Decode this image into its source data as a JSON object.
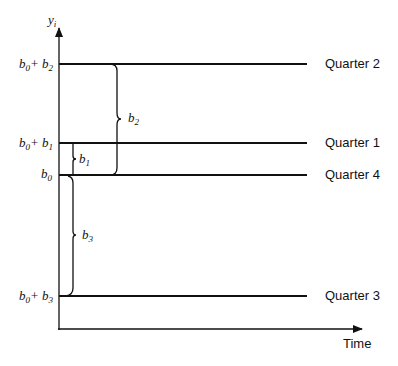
{
  "diagram": {
    "y_axis_label": "y",
    "y_axis_label_sub": "i",
    "x_axis_label": "Time",
    "levels": [
      {
        "id": "q2",
        "label": "Quarter 2",
        "tick_base": "b",
        "tick_base_sub": "0",
        "tick_plus": "+ b",
        "tick_plus_sub": "2",
        "y": 64
      },
      {
        "id": "q1",
        "label": "Quarter 1",
        "tick_base": "b",
        "tick_base_sub": "0",
        "tick_plus": "+ b",
        "tick_plus_sub": "1",
        "y": 143
      },
      {
        "id": "q4",
        "label": "Quarter 4",
        "tick_base": "b",
        "tick_base_sub": "0",
        "tick_plus": "",
        "tick_plus_sub": "",
        "y": 175
      },
      {
        "id": "q3",
        "label": "Quarter 3",
        "tick_base": "b",
        "tick_base_sub": "0",
        "tick_plus": "+ b",
        "tick_plus_sub": "3",
        "y": 296
      }
    ],
    "braces": [
      {
        "label": "b",
        "sub": "2",
        "from": "Quarter 4",
        "to": "Quarter 2"
      },
      {
        "label": "b",
        "sub": "1",
        "from": "Quarter 4",
        "to": "Quarter 1"
      },
      {
        "label": "b",
        "sub": "3",
        "from": "Quarter 4",
        "to": "Quarter 3"
      }
    ]
  }
}
